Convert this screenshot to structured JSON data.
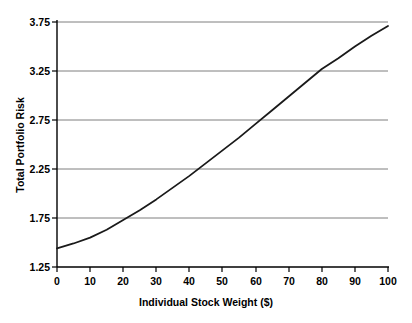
{
  "chart_data": {
    "type": "line",
    "title": "",
    "xlabel": "Individual Stock Weight ($)",
    "ylabel": "Total Portfolio Risk",
    "xlim": [
      0,
      100
    ],
    "ylim": [
      1.25,
      3.75
    ],
    "xticks": [
      "0",
      "10",
      "20",
      "30",
      "40",
      "50",
      "60",
      "70",
      "80",
      "90",
      "100"
    ],
    "yticks": [
      "1.25",
      "1.75",
      "2.25",
      "2.75",
      "3.25",
      "3.75"
    ],
    "grid": "horizontal",
    "legend": "none",
    "series": [
      {
        "name": "Total Portfolio Risk",
        "color": "#1a1a1a",
        "x": [
          0,
          5,
          10,
          15,
          20,
          25,
          30,
          35,
          40,
          45,
          50,
          55,
          60,
          65,
          70,
          75,
          80,
          85,
          90,
          95,
          100
        ],
        "values": [
          1.44,
          1.49,
          1.55,
          1.63,
          1.73,
          1.83,
          1.94,
          2.06,
          2.18,
          2.31,
          2.44,
          2.57,
          2.71,
          2.85,
          2.99,
          3.13,
          3.27,
          3.38,
          3.5,
          3.61,
          3.71
        ]
      }
    ],
    "annotations": []
  },
  "axis": {
    "y_tick_values": [
      "3.75",
      "3.25",
      "2.75",
      "2.25",
      "1.75",
      "1.25"
    ],
    "x_tick_values": [
      "0",
      "10",
      "20",
      "30",
      "40",
      "50",
      "60",
      "70",
      "80",
      "90",
      "100"
    ]
  },
  "colors": {
    "curve": "#1a1a1a",
    "axis": "#000000",
    "grid": "#808080",
    "background": "#ffffff"
  }
}
